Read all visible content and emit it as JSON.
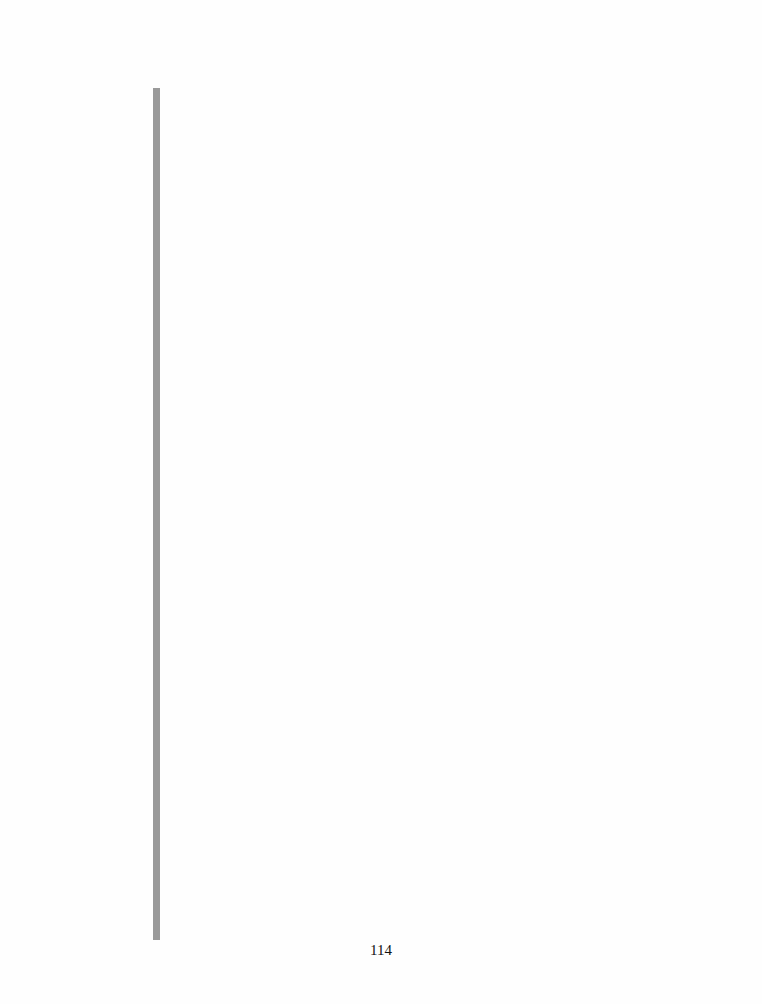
{
  "page": {
    "number": "114",
    "rule_color": "#9a9a9a",
    "background": "#fefefe"
  }
}
